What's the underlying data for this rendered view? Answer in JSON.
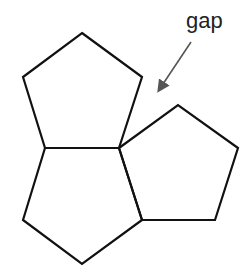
{
  "diagram": {
    "annotation": {
      "label": "gap",
      "arrow_color": "#555555"
    },
    "stroke_color": "#111111",
    "shapes": [
      {
        "name": "top-pentagon",
        "points": "82,33 142,77 119,148 45,148 23,77"
      },
      {
        "name": "bottom-pentagon",
        "points": "45,148 119,148 142,220 82,264 23,220"
      },
      {
        "name": "right-pentagon",
        "points": "119,148 178,105 238,148 215,220 142,220"
      }
    ]
  }
}
